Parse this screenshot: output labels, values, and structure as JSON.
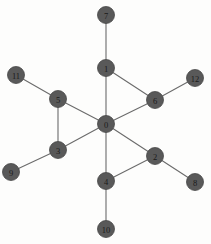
{
  "figure": {
    "title": "",
    "width": 211,
    "height": 244,
    "background_color": "#fdfdfc"
  },
  "chart_data": {
    "type": "diagram",
    "diagram_kind": "node-link-graph",
    "title": "",
    "node_color": "#595959",
    "node_label_color": "#1a1a1a",
    "edge_color": "#6b6b6b",
    "node_radius": 8.5,
    "nodes": [
      {
        "id": "0",
        "label": "0",
        "x": 106,
        "y": 124
      },
      {
        "id": "1",
        "label": "1",
        "x": 106,
        "y": 68
      },
      {
        "id": "2",
        "label": "2",
        "x": 155,
        "y": 156
      },
      {
        "id": "3",
        "label": "3",
        "x": 58,
        "y": 150
      },
      {
        "id": "4",
        "label": "4",
        "x": 106,
        "y": 181
      },
      {
        "id": "5",
        "label": "5",
        "x": 58,
        "y": 99
      },
      {
        "id": "6",
        "label": "6",
        "x": 155,
        "y": 100
      },
      {
        "id": "7",
        "label": "7",
        "x": 106,
        "y": 15
      },
      {
        "id": "8",
        "label": "8",
        "x": 195,
        "y": 182
      },
      {
        "id": "9",
        "label": "9",
        "x": 11,
        "y": 172
      },
      {
        "id": "10",
        "label": "10",
        "x": 106,
        "y": 229
      },
      {
        "id": "11",
        "label": "11",
        "x": 16,
        "y": 75
      },
      {
        "id": "12",
        "label": "12",
        "x": 195,
        "y": 78
      }
    ],
    "edges": [
      {
        "source": "0",
        "target": "1"
      },
      {
        "source": "0",
        "target": "2"
      },
      {
        "source": "0",
        "target": "3"
      },
      {
        "source": "0",
        "target": "4"
      },
      {
        "source": "0",
        "target": "5"
      },
      {
        "source": "0",
        "target": "6"
      },
      {
        "source": "1",
        "target": "6"
      },
      {
        "source": "1",
        "target": "7"
      },
      {
        "source": "2",
        "target": "4"
      },
      {
        "source": "2",
        "target": "8"
      },
      {
        "source": "3",
        "target": "5"
      },
      {
        "source": "3",
        "target": "9"
      },
      {
        "source": "4",
        "target": "10"
      },
      {
        "source": "5",
        "target": "11"
      },
      {
        "source": "6",
        "target": "12"
      }
    ]
  }
}
